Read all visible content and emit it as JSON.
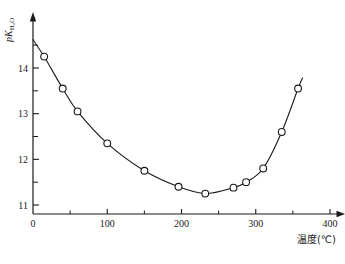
{
  "figure": {
    "background_color": "#ffffff",
    "ink_color": "#1a1a1a",
    "y_axis_title_parts": {
      "p": "p",
      "K": "K",
      "subscript": "H₂O"
    },
    "y_axis_title_plain": "pK(H2O)"
  },
  "chart_data": {
    "type": "line",
    "title": "",
    "subtitle": "",
    "xlabel": "温度(℃)",
    "ylabel": "pK(H2O)",
    "xlim": [
      0,
      420
    ],
    "ylim": [
      10.6,
      14.95
    ],
    "xticks": [
      0,
      100,
      200,
      300,
      400
    ],
    "xtick_labels": [
      "0",
      "100",
      "200",
      "300",
      "400"
    ],
    "xminor_ticks": [
      50,
      150,
      250,
      350
    ],
    "yticks": [
      11,
      12,
      13,
      14
    ],
    "ytick_labels": [
      "11",
      "12",
      "13",
      "14"
    ],
    "yminor_ticks": [
      11.5,
      12.5,
      13.5,
      14.5
    ],
    "grid": false,
    "legend": false,
    "marker": "open-circle",
    "marker_radius": 3.4,
    "line_width": 1.1,
    "series": [
      {
        "name": "pKw vs temperature",
        "x": [
          15,
          40,
          60,
          100,
          150,
          196,
          232,
          270,
          287,
          310,
          335,
          357
        ],
        "y": [
          14.25,
          13.55,
          13.05,
          12.35,
          11.75,
          11.4,
          11.25,
          11.38,
          11.5,
          11.8,
          12.6,
          13.55
        ]
      }
    ],
    "curve_start": {
      "x": 0,
      "y": 14.62
    },
    "curve_end": {
      "x": 363,
      "y": 13.78
    },
    "annotations": []
  }
}
